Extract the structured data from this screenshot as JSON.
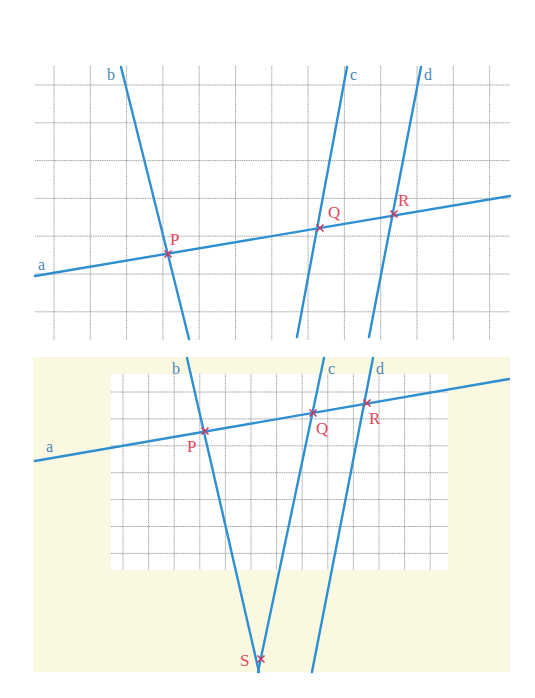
{
  "colors": {
    "line": "#2f8fd0",
    "line_label": "#4a86b8",
    "point": "#e2485c",
    "marker": "#c63a66",
    "grid": "#8a8a8a",
    "cream": "#fbf8e2",
    "panel": "#ffffff"
  },
  "figure_top": {
    "lines": [
      {
        "label": "a",
        "x1": 35,
        "y1": 276,
        "x2": 510,
        "y2": 196,
        "lx": 38,
        "ly": 270
      },
      {
        "label": "b",
        "x1": 121,
        "y1": 67,
        "x2": 189,
        "y2": 339,
        "lx": 107,
        "ly": 80
      },
      {
        "label": "c",
        "x1": 347,
        "y1": 67,
        "x2": 297,
        "y2": 337,
        "lx": 350,
        "ly": 80
      },
      {
        "label": "d",
        "x1": 421,
        "y1": 67,
        "x2": 369,
        "y2": 337,
        "lx": 424,
        "ly": 80
      }
    ],
    "points": [
      {
        "label": "P",
        "x": 168,
        "y": 254,
        "lx": 170,
        "ly": 245
      },
      {
        "label": "Q",
        "x": 320,
        "y": 228,
        "lx": 328,
        "ly": 218
      },
      {
        "label": "R",
        "x": 394,
        "y": 214,
        "lx": 398,
        "ly": 206
      }
    ]
  },
  "figure_bottom": {
    "lines": [
      {
        "label": "a",
        "x1": 35,
        "y1": 461,
        "x2": 509,
        "y2": 379,
        "lx": 46,
        "ly": 452
      },
      {
        "label": "b",
        "x1": 187,
        "y1": 358,
        "x2": 259,
        "y2": 672,
        "lx": 172,
        "ly": 374
      },
      {
        "label": "c",
        "x1": 324,
        "y1": 358,
        "x2": 258,
        "y2": 672,
        "lx": 328,
        "ly": 374
      },
      {
        "label": "d",
        "x1": 373,
        "y1": 358,
        "x2": 312,
        "y2": 672,
        "lx": 376,
        "ly": 374
      }
    ],
    "points": [
      {
        "label": "P",
        "x": 205,
        "y": 431,
        "lx": 187,
        "ly": 452
      },
      {
        "label": "Q",
        "x": 313,
        "y": 413,
        "lx": 316,
        "ly": 434
      },
      {
        "label": "R",
        "x": 367,
        "y": 403,
        "lx": 369,
        "ly": 424
      },
      {
        "label": "S",
        "x": 261,
        "y": 659,
        "lx": 240,
        "ly": 666
      }
    ]
  }
}
